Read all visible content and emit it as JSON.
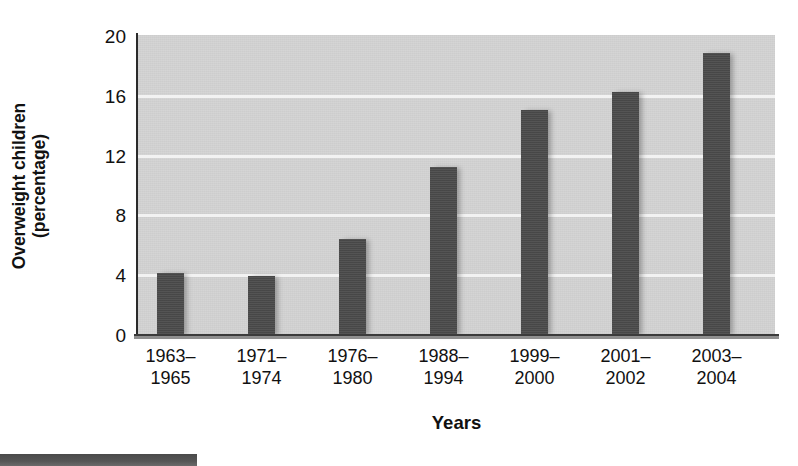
{
  "chart_data": {
    "type": "bar",
    "title": "",
    "subtitle": "",
    "xlabel": "Years",
    "ylabel_line1": "Overweight children",
    "ylabel_line2": "(percentage)",
    "ylabel": "Overweight children (percentage)",
    "categories": [
      "1963–1965",
      "1971–1974",
      "1976–1980",
      "1988–1994",
      "1999–2000",
      "2001–2002",
      "2003–2004"
    ],
    "category_lines": [
      {
        "l1": "1963–",
        "l2": "1965"
      },
      {
        "l1": "1971–",
        "l2": "1974"
      },
      {
        "l1": "1976–",
        "l2": "1980"
      },
      {
        "l1": "1988–",
        "l2": "1994"
      },
      {
        "l1": "1999–",
        "l2": "2000"
      },
      {
        "l1": "2001–",
        "l2": "2002"
      },
      {
        "l1": "2003–",
        "l2": "2004"
      }
    ],
    "values": [
      4.2,
      4.0,
      6.5,
      11.3,
      15.1,
      16.3,
      18.9
    ],
    "ylim": [
      0,
      20
    ],
    "yticks": [
      0,
      4,
      8,
      12,
      16,
      20
    ],
    "ytick_labels": [
      "0",
      "4",
      "8",
      "12",
      "16",
      "20"
    ],
    "grid": true,
    "grid_axis": "y",
    "legend": false,
    "legend_position": "none",
    "bar_color": "#4b4b4b",
    "plot_background": "#d4d4d4",
    "gridline_color": "#f2f2f2",
    "axis_color": "#2b2b2b",
    "text_color": "#111111"
  }
}
